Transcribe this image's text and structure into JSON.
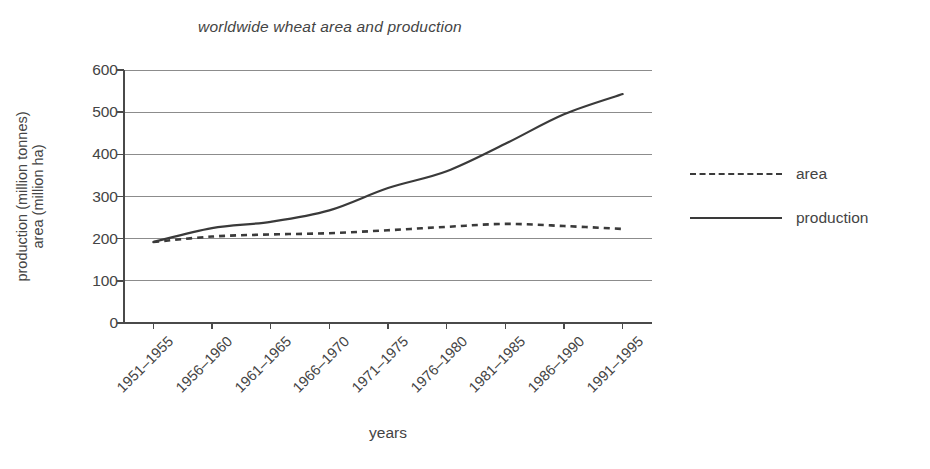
{
  "chart_data": {
    "type": "line",
    "title": "worldwide wheat area and production",
    "xlabel": "years",
    "ylabel_lines": [
      "area (million ha)",
      "production (million tonnes)"
    ],
    "categories": [
      "1951–1955",
      "1956–1960",
      "1961–1965",
      "1966–1970",
      "1971–1975",
      "1976–1980",
      "1981–1985",
      "1986–1990",
      "1991–1995"
    ],
    "yticks": [
      0,
      100,
      200,
      300,
      400,
      500,
      600
    ],
    "ytick_labels": [
      "0",
      "100",
      "200",
      "300",
      "400",
      "500",
      "600"
    ],
    "ylim": [
      0,
      600
    ],
    "grid": true,
    "grid_axis": "y",
    "legend_position": "right",
    "series": [
      {
        "name": "area",
        "style": "dotted",
        "color": "#3a3a3a",
        "values": [
          192,
          205,
          210,
          213,
          220,
          228,
          235,
          230,
          223
        ]
      },
      {
        "name": "production",
        "style": "solid",
        "color": "#3a3a3a",
        "values": [
          192,
          225,
          240,
          267,
          320,
          360,
          425,
          495,
          543
        ]
      }
    ]
  },
  "legend": {
    "items": [
      {
        "label": "area",
        "style": "dotted"
      },
      {
        "label": "production",
        "style": "solid"
      }
    ]
  }
}
